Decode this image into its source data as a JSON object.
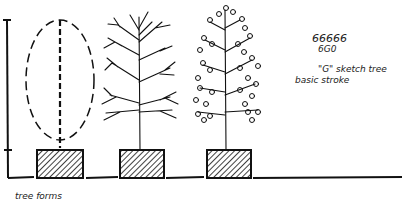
{
  "diagram": {
    "title": "tree forms",
    "annotations": {
      "line1": "66666",
      "line2": "6G0",
      "line3": "\"G\" sketch tree",
      "line4": "basic stroke"
    },
    "stages": [
      {
        "name": "outline-form",
        "description": "dashed oval canopy with dashed trunk"
      },
      {
        "name": "branch-structure",
        "description": "bare branching tree"
      },
      {
        "name": "leafed-tree",
        "description": "branches with G-stroke leaves"
      }
    ],
    "colors": {
      "ink": "#111111",
      "paper": "#ffffff"
    }
  }
}
